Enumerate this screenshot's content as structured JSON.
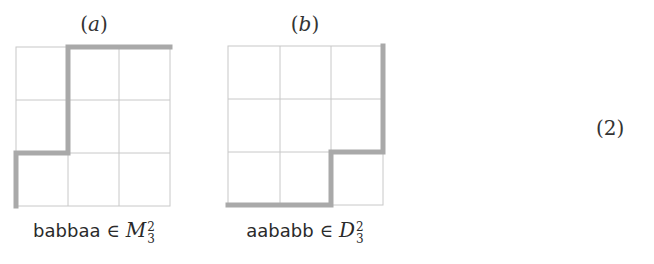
{
  "figures": [
    {
      "label": "a",
      "caption_word": "babbaa",
      "caption_relation": "∈",
      "caption_set": "M",
      "caption_sup": "2",
      "caption_sub": "3",
      "grid": {
        "rows": 3,
        "cols": 3
      },
      "path": "left-up, right, up-up, right-right"
    },
    {
      "label": "b",
      "caption_word": "aababb",
      "caption_relation": "∈",
      "caption_set": "D",
      "caption_sup": "2",
      "caption_sub": "3",
      "grid": {
        "rows": 3,
        "cols": 3
      },
      "path": "right-right, up, right, up-up"
    }
  ],
  "equation_number": "(2)",
  "colors": {
    "grid_line": "#c8c8c8",
    "path_line": "#a9a9a9",
    "text": "#2a2a2a"
  }
}
